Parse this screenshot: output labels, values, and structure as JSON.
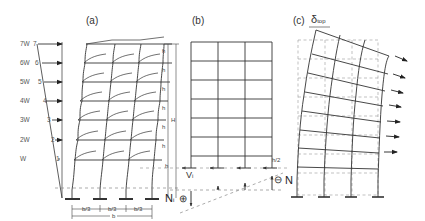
{
  "panels": {
    "a": {
      "label": "(a)"
    },
    "b": {
      "label": "(b)"
    },
    "c": {
      "label": "(c)",
      "delta_label": "δ",
      "delta_sub": "top"
    }
  },
  "loads": [
    {
      "force": "7W",
      "floor": "7"
    },
    {
      "force": "6W",
      "floor": "6"
    },
    {
      "force": "5W",
      "floor": "5"
    },
    {
      "force": "4W",
      "floor": "4"
    },
    {
      "force": "3W",
      "floor": "3"
    },
    {
      "force": "2W",
      "floor": "2"
    },
    {
      "force": "W",
      "floor": "1"
    }
  ],
  "dimensions": {
    "story_height": "h",
    "total_height": "H",
    "bay_width": "b/3",
    "total_width": "b",
    "half_story": "h/2"
  },
  "forces": {
    "shear": "V",
    "shear_sub": "i",
    "axial_left": "N",
    "axial_left_sub": "i",
    "axial_right": "N",
    "plus_sign": "⊕",
    "minus_sign": "⊖"
  },
  "colors": {
    "line": "#333333",
    "dashed": "#888888"
  }
}
